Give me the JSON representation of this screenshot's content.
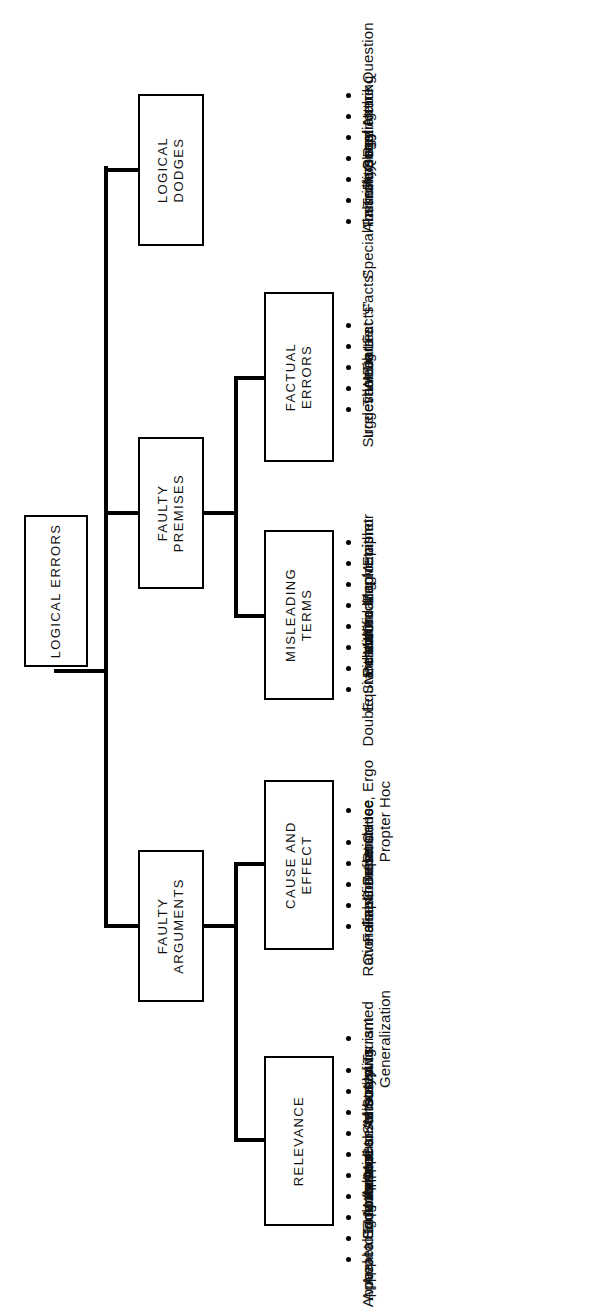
{
  "diagram": {
    "title": "Logical Errors",
    "type": "hierarchy-tree",
    "root": {
      "label": "LOGICAL ERRORS"
    },
    "branches": [
      {
        "id": "faulty-arguments",
        "label": "FAULTY ARGUMENTS",
        "label_lines": [
          "FAULTY",
          "ARGUMENTS"
        ],
        "children": [
          {
            "id": "relevance",
            "label": "RELEVANCE",
            "label_lines": [
              "RELEVANCE"
            ],
            "items": [
              {
                "lines": [
                  "Unwarranted",
                  "Generalization"
                ],
                "text": "Unwarranted Generalization"
              },
              {
                "lines": [
                  "Misused Truism"
                ],
                "text": "Misused Truism"
              },
              {
                "lines": [
                  "Stereotyping"
                ],
                "text": "Stereotyping"
              },
              {
                "lines": [
                  "Misuse of Statistics"
                ],
                "text": "Misuse of Statistics"
              },
              {
                "lines": [
                  "Appeal to Authority"
                ],
                "text": "Appeal to Authority"
              },
              {
                "lines": [
                  "Appeal to Consensus"
                ],
                "text": "Appeal to Consensus"
              },
              {
                "lines": [
                  "Mob Appeal"
                ],
                "text": "Mob Appeal"
              },
              {
                "lines": [
                  "Snob Appeal"
                ],
                "text": "Snob Appeal"
              },
              {
                "lines": [
                  "Appeal to Ignorance"
                ],
                "text": "Appeal to Ignorance"
              },
              {
                "lines": [
                  "Appeal to Emotion"
                ],
                "text": "Appeal to Emotion"
              },
              {
                "lines": [
                  "Appeal to Ego"
                ],
                "text": "Appeal to Ego"
              }
            ]
          },
          {
            "id": "cause-and-effect",
            "label": "CAUSE AND EFFECT",
            "label_lines": [
              "CAUSE AND",
              "EFFECT"
            ],
            "items": [
              {
                "lines": [
                  "Post Hoc, Ergo",
                  "Propter Hoc"
                ],
                "text": "Post Hoc, Ergo Propter Hoc"
              },
              {
                "lines": [
                  "False Cause"
                ],
                "text": "False Cause"
              },
              {
                "lines": [
                  "False Dependence"
                ],
                "text": "False Dependence"
              },
              {
                "lines": [
                  "False Correlation"
                ],
                "text": "False Correlation"
              },
              {
                "lines": [
                  "Oversimplification"
                ],
                "text": "Oversimplification"
              },
              {
                "lines": [
                  "Rationalization"
                ],
                "text": "Rationalization"
              }
            ]
          }
        ]
      },
      {
        "id": "faulty-premises",
        "label": "FAULTY PREMISES",
        "label_lines": [
          "FAULTY",
          "PREMISES"
        ],
        "children": [
          {
            "id": "misleading-terms",
            "label": "MISLEADING TERMS",
            "label_lines": [
              "MISLEADING",
              "TERMS"
            ],
            "items": [
              {
                "lines": [
                  "Epithet"
                ],
                "text": "Epithet"
              },
              {
                "lines": [
                  "Euphemism"
                ],
                "text": "Euphemism"
              },
              {
                "lines": [
                  "Misleading Metaphor"
                ],
                "text": "Misleading Metaphor"
              },
              {
                "lines": [
                  "Word Magic"
                ],
                "text": "Word Magic"
              },
              {
                "lines": [
                  "Personification"
                ],
                "text": "Personification"
              },
              {
                "lines": [
                  "Either/Or"
                ],
                "text": "Either/Or"
              },
              {
                "lines": [
                  "Equivocation"
                ],
                "text": "Equivocation"
              },
              {
                "lines": [
                  "Double Standard"
                ],
                "text": "Double Standard"
              }
            ]
          },
          {
            "id": "factual-errors",
            "label": "FACTUAL ERRORS",
            "label_lines": [
              "FACTUAL",
              "ERRORS"
            ],
            "items": [
              {
                "lines": [
                  "Incorrect “Facts”"
                ],
                "text": "Incorrect “Facts”"
              },
              {
                "lines": [
                  "Weak “Facts”"
                ],
                "text": "Weak “Facts”"
              },
              {
                "lines": [
                  "The Big Lie"
                ],
                "text": "The Big Lie"
              },
              {
                "lines": [
                  "Irrelevant Data"
                ],
                "text": "Irrelevant Data"
              },
              {
                "lines": [
                  "Suggestion"
                ],
                "text": "Suggestion"
              }
            ]
          }
        ]
      },
      {
        "id": "logical-dodges",
        "label": "LOGICAL DODGES",
        "label_lines": [
          "LOGICAL",
          "DODGES"
        ],
        "children": [],
        "items": [
          {
            "lines": [
              "Begging the Question"
            ],
            "text": "Begging the Question"
          },
          {
            "lines": [
              "Red Herring"
            ],
            "text": "Red Herring"
          },
          {
            "lines": [
              "Personal Attack"
            ],
            "text": "Personal Attack"
          },
          {
            "lines": [
              "Trick Question"
            ],
            "text": "Trick Question"
          },
          {
            "lines": [
              "False Analogy"
            ],
            "text": "False Analogy"
          },
          {
            "lines": [
              "Absurdity"
            ],
            "text": "Absurdity"
          },
          {
            "lines": [
              "Special Immunity"
            ],
            "text": "Special Immunity"
          }
        ]
      }
    ],
    "colors": {
      "line": "#000000",
      "box_border": "#000000",
      "background": "#ffffff",
      "text": "#111111"
    }
  }
}
